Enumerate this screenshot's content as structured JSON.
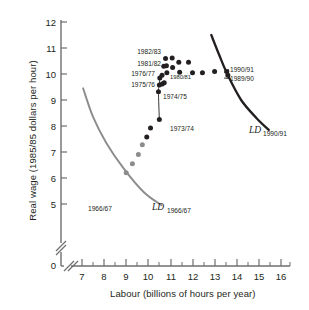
{
  "chart_data": {
    "type": "scatter",
    "title": "",
    "xlabel": "Labour (billions of hours per year)",
    "ylabel": "Real wage (1985/85 dollars per hour)",
    "xlim": [
      6.6,
      16.3
    ],
    "ylim": [
      4.55,
      12.1
    ],
    "xticks": [
      "7",
      "8",
      "9",
      "10",
      "11",
      "12",
      "13",
      "14",
      "15",
      "16"
    ],
    "yticks": [
      "0",
      "5",
      "6",
      "7",
      "8",
      "9",
      "10",
      "11",
      "12"
    ],
    "axis_break": true,
    "grid": false,
    "legend": "none",
    "colors": {
      "early_points": "#8c8c8c",
      "late_points": "#231f20",
      "ld_1966_curve": "#8c8c8c",
      "ld_1990_curve": "#231f20",
      "axis": "#6f6f6f"
    },
    "series": [
      {
        "name": "Labour market outcomes 1966/67 - 1990/91",
        "points": [
          {
            "label": "1966/67",
            "x": 9.0,
            "y": 6.2,
            "shade": "early"
          },
          {
            "label": "",
            "x": 9.28,
            "y": 6.55,
            "shade": "early"
          },
          {
            "label": "",
            "x": 9.55,
            "y": 6.9,
            "shade": "early"
          },
          {
            "label": "",
            "x": 9.73,
            "y": 7.28,
            "shade": "early"
          },
          {
            "label": "",
            "x": 9.93,
            "y": 7.58,
            "shade": "late"
          },
          {
            "label": "",
            "x": 10.1,
            "y": 7.92,
            "shade": "late"
          },
          {
            "label": "1973/74",
            "x": 10.5,
            "y": 8.25,
            "shade": "late"
          },
          {
            "label": "1974/75",
            "x": 10.46,
            "y": 9.32,
            "shade": "late"
          },
          {
            "label": "1975/76",
            "x": 10.5,
            "y": 9.58,
            "shade": "late"
          },
          {
            "label": "",
            "x": 10.63,
            "y": 9.62,
            "shade": "late"
          },
          {
            "label": "",
            "x": 10.72,
            "y": 9.66,
            "shade": "late"
          },
          {
            "label": "1976/77",
            "x": 10.52,
            "y": 9.85,
            "shade": "late"
          },
          {
            "label": "",
            "x": 10.62,
            "y": 9.95,
            "shade": "late"
          },
          {
            "label": "1981/82",
            "x": 10.7,
            "y": 10.3,
            "shade": "late"
          },
          {
            "label": "",
            "x": 10.82,
            "y": 10.32,
            "shade": "late"
          },
          {
            "label": "1982/83",
            "x": 10.78,
            "y": 10.6,
            "shade": "late"
          },
          {
            "label": "1980/81",
            "x": 10.84,
            "y": 10.05,
            "shade": "late"
          },
          {
            "label": "",
            "x": 11.08,
            "y": 10.62,
            "shade": "late"
          },
          {
            "label": "",
            "x": 11.1,
            "y": 10.25,
            "shade": "late"
          },
          {
            "label": "",
            "x": 11.38,
            "y": 10.45,
            "shade": "late"
          },
          {
            "label": "",
            "x": 11.42,
            "y": 10.07,
            "shade": "late"
          },
          {
            "label": "",
            "x": 11.82,
            "y": 10.45,
            "shade": "late"
          },
          {
            "label": "",
            "x": 12.0,
            "y": 10.05,
            "shade": "late"
          },
          {
            "label": "",
            "x": 12.45,
            "y": 10.05,
            "shade": "late"
          },
          {
            "label": "",
            "x": 13.0,
            "y": 10.1,
            "shade": "late"
          },
          {
            "label": "1990/91",
            "x": 13.55,
            "y": 10.1,
            "shade": "late"
          },
          {
            "label": "1989/90",
            "x": 13.6,
            "y": 9.95,
            "shade": "late"
          }
        ]
      }
    ],
    "annotations": [
      {
        "text": "1982/83",
        "x": 10.78,
        "y": 10.6
      },
      {
        "text": "1981/82",
        "x": 10.7,
        "y": 10.3
      },
      {
        "text": "1980/81",
        "x": 10.84,
        "y": 10.05
      },
      {
        "text": "1976/77",
        "x": 10.52,
        "y": 9.85
      },
      {
        "text": "1975/76",
        "x": 10.5,
        "y": 9.58
      },
      {
        "text": "1974/75",
        "x": 10.46,
        "y": 9.32
      },
      {
        "text": "1973/74",
        "x": 10.5,
        "y": 8.25
      },
      {
        "text": "1966/67",
        "x": 9.0,
        "y": 6.2
      },
      {
        "text": "1990/91",
        "x": 13.55,
        "y": 10.1
      },
      {
        "text": "1989/90",
        "x": 13.6,
        "y": 9.95
      }
    ],
    "curves": [
      {
        "name": "LD",
        "subscript": "1966/67",
        "color": "#8c8c8c",
        "points": [
          [
            7.05,
            9.45
          ],
          [
            7.5,
            8.35
          ],
          [
            8.1,
            7.35
          ],
          [
            8.9,
            6.35
          ],
          [
            9.8,
            5.45
          ],
          [
            10.6,
            4.95
          ]
        ]
      },
      {
        "name": "LD",
        "subscript": "1990/91",
        "color": "#231f20",
        "points": [
          [
            12.85,
            11.5
          ],
          [
            13.2,
            10.75
          ],
          [
            13.6,
            9.95
          ],
          [
            14.2,
            9.0
          ],
          [
            14.9,
            8.3
          ],
          [
            15.45,
            7.85
          ]
        ]
      }
    ]
  },
  "labels": {
    "y_axis_title": "Real wage (1985/85 dollars per hour)",
    "x_axis_title": "Labour (billions of hours per year)",
    "ld_early_name": "LD",
    "ld_early_sub": "1966/67",
    "ld_late_name": "LD",
    "ld_late_sub": "1990/91",
    "pt_1982_83": "1982/83",
    "pt_1981_82": "1981/82",
    "pt_1980_81": "1980/81",
    "pt_1976_77": "1976/77",
    "pt_1975_76": "1975/76",
    "pt_1974_75": "1974/75",
    "pt_1973_74": "1973/74",
    "pt_1966_67": "1966/67",
    "pt_1990_91": "1990/91",
    "pt_1989_90": "1989/90"
  },
  "ticks": {
    "x": [
      "7",
      "8",
      "9",
      "10",
      "11",
      "12",
      "13",
      "14",
      "15",
      "16"
    ],
    "y": [
      "12",
      "11",
      "10",
      "9",
      "8",
      "7",
      "6",
      "5",
      "0"
    ]
  }
}
